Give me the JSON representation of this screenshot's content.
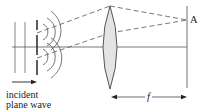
{
  "figure": {
    "type": "optics-diagram",
    "labels": {
      "incident_line1": "incident",
      "incident_line2": "plane wave",
      "point": "A",
      "focal_length": "f"
    },
    "colors": {
      "line": "#555555",
      "lens_fill": "#e4e4e4",
      "lens_stroke": "#444444",
      "screen": "#888888",
      "text": "#222222"
    },
    "elements": {
      "plane_wavefronts": 2,
      "slits": 2,
      "diffracted_wavefronts_per_slit": 3,
      "lens": "biconvex",
      "screen": "vertical line at focal plane"
    }
  }
}
